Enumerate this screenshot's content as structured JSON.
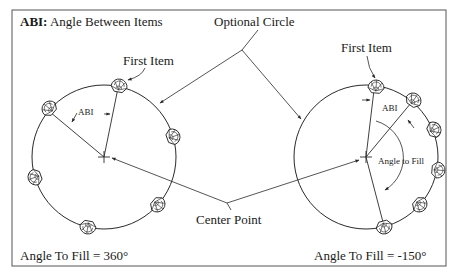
{
  "title": {
    "abbr": "ABI:",
    "text": " Angle Between Items"
  },
  "labels": {
    "optional_circle": "Optional Circle",
    "first_item_left": "First Item",
    "first_item_right": "First Item",
    "center_point": "Center Point",
    "abi_left": "ABI",
    "abi_right": "ABI",
    "angle_to_fill_inner": "Angle to Fill"
  },
  "captions": {
    "left": "Angle To Fill = 360°",
    "right": "Angle To Fill = -150°"
  },
  "examples": [
    {
      "name": "full-circle-pattern",
      "angle_to_fill": 360,
      "item_count": 6
    },
    {
      "name": "partial-arc-pattern",
      "angle_to_fill": -150,
      "item_count": 6
    }
  ],
  "colors": {
    "line": "#2a2a2a",
    "text": "#1a1a1a",
    "background": "#ffffff",
    "frame": "#555555"
  }
}
